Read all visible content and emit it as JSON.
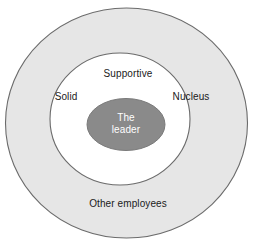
{
  "diagram": {
    "type": "concentric-circles",
    "background_color": "#ffffff",
    "stroke_color": "#6b6b6b",
    "rings": [
      {
        "id": "outer",
        "name": "other-employees",
        "label": "Other employees",
        "fill_color": "#e6e6e6",
        "text_color": "#1a1a1a",
        "level": 3
      },
      {
        "id": "middle",
        "name": "inner-team",
        "fill_color": "#ffffff",
        "text_color": "#1a1a1a",
        "level": 2,
        "labels": [
          {
            "id": "supportive",
            "label": "Supportive"
          },
          {
            "id": "solid",
            "label": "Solid"
          },
          {
            "id": "nucleus",
            "label": "Nucleus"
          }
        ]
      },
      {
        "id": "core",
        "name": "the-leader",
        "label_line1": "The",
        "label_line2": "leader",
        "fill_color": "#8a8a8a",
        "text_color": "#ffffff",
        "level": 1
      }
    ]
  },
  "labels": {
    "supportive": "Supportive",
    "solid": "Solid",
    "nucleus": "Nucleus",
    "other_employees": "Other employees",
    "leader_line1": "The",
    "leader_line2": "leader"
  },
  "colors": {
    "outer_ring_fill": "#e6e6e6",
    "middle_ring_fill": "#ffffff",
    "core_fill": "#8a8a8a",
    "outline": "#6b6b6b",
    "text_dark": "#1a1a1a",
    "text_light": "#ffffff",
    "page_background": "#ffffff"
  }
}
